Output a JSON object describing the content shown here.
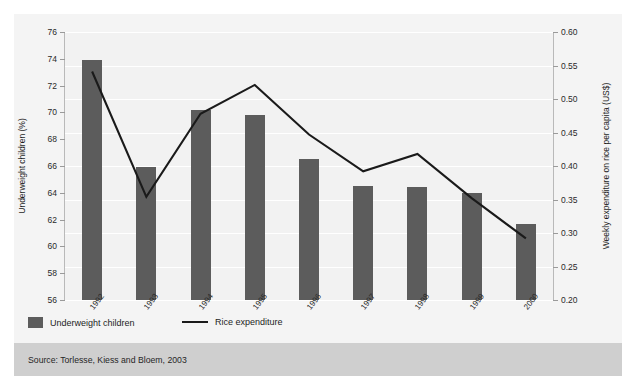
{
  "figure": {
    "source_note": "Source: Torlesse, Kiess and Bloem, 2003",
    "bar_color": "#5c5c5c",
    "line_color": "#1a1a1a",
    "plot_bg": "#f2f2f2",
    "panel_bg": "#f4f4f4",
    "source_band_bg": "#cfcfcf"
  },
  "legend": {
    "items": [
      {
        "label": "Underweight children",
        "marker": "bar-swatch"
      },
      {
        "label": "Rice expenditure",
        "marker": "line-swatch"
      }
    ]
  },
  "chart_data": {
    "type": "bar",
    "title": "",
    "xlabel": "",
    "grid": true,
    "legend_position": "bottom-left",
    "categories": [
      "1992",
      "1993",
      "1994",
      "1995",
      "1996",
      "1997",
      "1998",
      "1999",
      "2000"
    ],
    "axes": {
      "left": {
        "label": "Underweight children (%)",
        "ylim": [
          56,
          76
        ],
        "ticks": [
          56,
          58,
          60,
          62,
          64,
          66,
          68,
          70,
          72,
          74,
          76
        ],
        "tick_labels": [
          "56",
          "58",
          "60",
          "62",
          "64",
          "66",
          "68",
          "70",
          "72",
          "74",
          "76"
        ]
      },
      "right": {
        "label": "Weekly expenditure on rice per capita (US$)",
        "ylim": [
          0.2,
          0.6
        ],
        "ticks": [
          0.2,
          0.25,
          0.3,
          0.35,
          0.4,
          0.45,
          0.5,
          0.55,
          0.6
        ],
        "tick_labels": [
          "0.20",
          "0.25",
          "0.30",
          "0.35",
          "0.40",
          "0.45",
          "0.50",
          "0.55",
          "0.60"
        ]
      }
    },
    "series": [
      {
        "name": "Underweight children",
        "type": "bar",
        "axis": "left",
        "unit": "%",
        "values": [
          73.9,
          65.9,
          70.2,
          69.8,
          66.5,
          64.5,
          64.4,
          64.0,
          61.7
        ]
      },
      {
        "name": "Rice expenditure",
        "type": "line",
        "axis": "right",
        "unit": "US$",
        "values": [
          0.541,
          0.354,
          0.478,
          0.521,
          0.447,
          0.392,
          0.418,
          0.352,
          0.292
        ]
      }
    ]
  }
}
